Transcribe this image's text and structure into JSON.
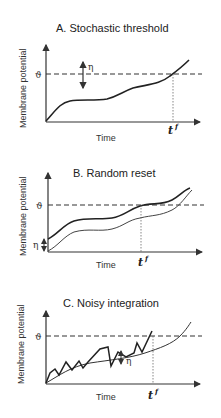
{
  "panels": [
    {
      "id": "A",
      "title": "A.  Stochastic threshold",
      "ylabel": "Membrane potential",
      "xlabel": "Time",
      "threshold_symbol": "ϑ",
      "noise_symbol": "η",
      "firing_time": "t",
      "firing_time_sup": "f"
    },
    {
      "id": "B",
      "title": "B.  Random reset",
      "ylabel": "Membrane potential",
      "xlabel": "Time",
      "threshold_symbol": "ϑ",
      "noise_symbol": "η",
      "firing_time": "t",
      "firing_time_sup": "f"
    },
    {
      "id": "C",
      "title": "C.  Noisy integration",
      "ylabel": "Membrane potential",
      "xlabel": "Time",
      "threshold_symbol": "ϑ",
      "noise_symbol": "η",
      "firing_time": "t",
      "firing_time_sup": "f"
    }
  ],
  "colors": {
    "line": "#222222",
    "thin_line": "#444444",
    "background": "#ffffff"
  }
}
